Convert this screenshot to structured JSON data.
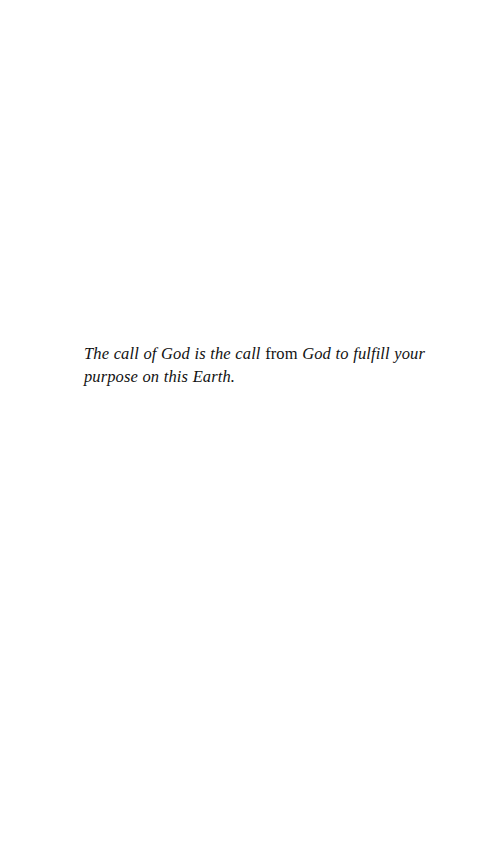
{
  "page": {
    "background_color": "#ffffff",
    "ink_color": "#121212"
  },
  "quote": {
    "segments": [
      {
        "text": "The call of God is the call ",
        "style": "italic"
      },
      {
        "text": "from ",
        "style": "roman"
      },
      {
        "text": "God to fulfill your purpose on this Earth.",
        "style": "italic"
      }
    ],
    "full_text": "The call of God is the call from God to fulfill your purpose on this Earth.",
    "part_one": "The call of God is the call ",
    "part_two": "from ",
    "part_three": "God to fulfill your purpose on this Earth."
  }
}
